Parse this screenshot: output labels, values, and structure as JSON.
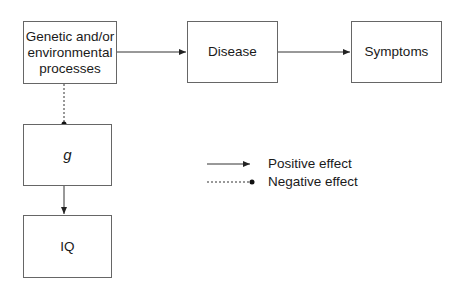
{
  "diagram": {
    "nodes": {
      "causes": "Genetic and/or environmental processes",
      "disease": "Disease",
      "symptoms": "Symptoms",
      "g": "g",
      "iq": "IQ"
    },
    "edges": [
      {
        "from": "causes",
        "to": "disease",
        "type": "positive"
      },
      {
        "from": "disease",
        "to": "symptoms",
        "type": "positive"
      },
      {
        "from": "causes",
        "to": "g",
        "type": "negative"
      },
      {
        "from": "g",
        "to": "iq",
        "type": "positive"
      }
    ],
    "legend": {
      "positive": "Positive effect",
      "negative": "Negative effect"
    }
  }
}
